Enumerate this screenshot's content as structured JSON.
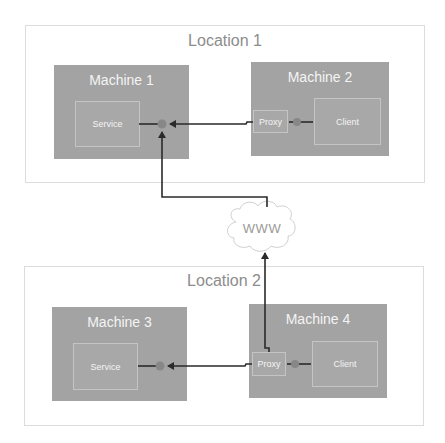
{
  "locations": [
    {
      "title": "Location 1"
    },
    {
      "title": "Location 2"
    }
  ],
  "machines": [
    {
      "title": "Machine 1",
      "component": "Service"
    },
    {
      "title": "Machine 2",
      "proxy": "Proxy",
      "component": "Client"
    },
    {
      "title": "Machine 3",
      "component": "Service"
    },
    {
      "title": "Machine 4",
      "proxy": "Proxy",
      "component": "Client"
    }
  ],
  "network": {
    "label": "WWW"
  },
  "colors": {
    "machine_fill": "#a3a3a3",
    "location_border": "#dcdcdc",
    "connector": "#2a2a2a",
    "endpoint": "#878787"
  }
}
